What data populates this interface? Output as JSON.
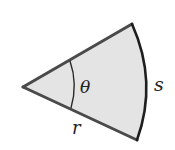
{
  "diagram": {
    "labels": {
      "angle": "θ",
      "arc": "s",
      "radius": "r"
    },
    "colors": {
      "fill": "#e4e4e4",
      "edge": "#4a4a4a",
      "arc": "#1e1e1e",
      "text": "#222222"
    },
    "geometry": {
      "vertex": [
        23,
        87
      ],
      "top_point": [
        132,
        24
      ],
      "bottom_point": [
        137,
        140
      ],
      "inner_arc_top": [
        70,
        61
      ],
      "inner_arc_bottom": [
        71,
        108
      ]
    }
  }
}
